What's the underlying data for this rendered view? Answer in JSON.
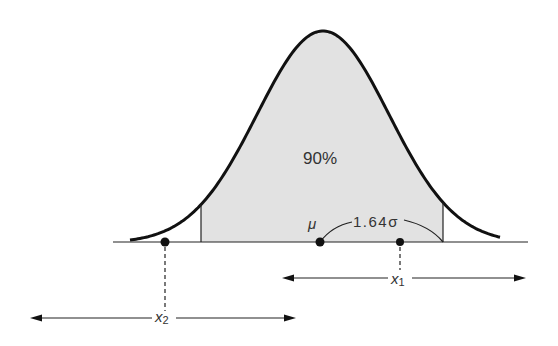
{
  "diagram": {
    "type": "normal-distribution",
    "area_label": "90%",
    "mean_label": "μ",
    "offset_label": "1.64σ",
    "x1_label": "x",
    "x1_sub": "1",
    "x2_label": "x",
    "x2_sub": "2"
  },
  "colors": {
    "fill": "#e2e2e2",
    "stroke": "#111111"
  }
}
